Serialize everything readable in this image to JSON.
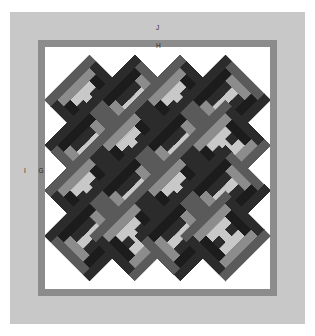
{
  "figure": {
    "type": "quilt-block-diagram",
    "title": "",
    "background_color": "#ffffff"
  },
  "labels": {
    "j": "J",
    "h": "H",
    "i": "I",
    "g": "G"
  },
  "borders": {
    "outer": {
      "letter": "J",
      "color": "#c8c8c8",
      "name": "outer-border"
    },
    "inner": {
      "letter": "H",
      "color": "#8c8c8c",
      "name": "inner-border"
    },
    "left_inner": {
      "letter": "G",
      "color": "#8c8c8c",
      "name": "left-inner-border"
    },
    "left_outer": {
      "letter": "I",
      "color": "#c8c8c8",
      "name": "left-outer-border"
    }
  },
  "palette": {
    "background": "#ffffff",
    "light_gray": "#c8c8c8",
    "mid_gray": "#8c8c8c",
    "dark_gray": "#5a5a5a",
    "near_black": "#2b2b2b",
    "black": "#1c1c1c",
    "outline": "#6e6e6e"
  },
  "chart_data": {
    "type": "heatmap",
    "xlabel": "",
    "ylabel": "",
    "grid_columns": 4,
    "grid_rows": 4,
    "block_size": 64,
    "ring_count": 3,
    "center_color": "#c8c8c8",
    "rings": [
      {
        "index": 0,
        "light_side": "#c8c8c8",
        "dark_side": "#2b2b2b"
      },
      {
        "index": 1,
        "light_side": "#8c8c8c",
        "dark_side": "#1c1c1c"
      },
      {
        "index": 2,
        "light_side": "#5a5a5a",
        "dark_side": "#2b2b2b"
      }
    ],
    "categories": [
      "r1c1",
      "r1c2",
      "r1c3",
      "r1c4",
      "r2c1",
      "r2c2",
      "r2c3",
      "r2c4",
      "r3c1",
      "r3c2",
      "r3c3",
      "r3c4",
      "r4c1",
      "r4c2",
      "r4c3",
      "r4c4"
    ],
    "values": [
      1,
      2,
      1,
      2,
      2,
      1,
      2,
      1,
      1,
      2,
      1,
      2,
      2,
      1,
      2,
      1
    ],
    "legend": [
      "light",
      "medium",
      "dark",
      "black"
    ]
  }
}
